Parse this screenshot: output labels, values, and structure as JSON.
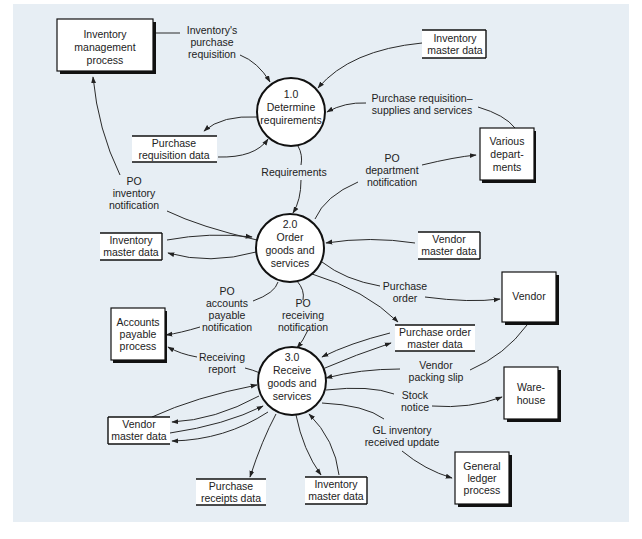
{
  "diagram": {
    "type": "data flow diagram",
    "processes": [
      {
        "id": "p1",
        "number": "1.0",
        "lines": [
          "Determine",
          "requirements"
        ]
      },
      {
        "id": "p2",
        "number": "2.0",
        "lines": [
          "Order",
          "goods and",
          "services"
        ]
      },
      {
        "id": "p3",
        "number": "3.0",
        "lines": [
          "Receive",
          "goods and",
          "services"
        ]
      }
    ],
    "entities": [
      {
        "id": "inv_mgmt",
        "lines": [
          "Inventory",
          "management",
          "process"
        ]
      },
      {
        "id": "various_depts",
        "lines": [
          "Various",
          "depart-",
          "ments"
        ]
      },
      {
        "id": "accounts_payable",
        "lines": [
          "Accounts",
          "payable",
          "process"
        ]
      },
      {
        "id": "vendor",
        "lines": [
          "Vendor"
        ]
      },
      {
        "id": "warehouse",
        "lines": [
          "Ware-",
          "house"
        ]
      },
      {
        "id": "general_ledger",
        "lines": [
          "General",
          "ledger",
          "process"
        ]
      }
    ],
    "data_stores": [
      {
        "id": "inv_master_top",
        "lines": [
          "Inventory",
          "master data"
        ]
      },
      {
        "id": "purchase_req_data",
        "lines": [
          "Purchase",
          "requisition data"
        ]
      },
      {
        "id": "inv_master_mid",
        "lines": [
          "Inventory",
          "master data"
        ]
      },
      {
        "id": "vendor_master_mid",
        "lines": [
          "Vendor",
          "master data"
        ]
      },
      {
        "id": "po_master",
        "lines": [
          "Purchase order",
          "master data"
        ]
      },
      {
        "id": "vendor_master_bottom",
        "lines": [
          "Vendor",
          "master data"
        ]
      },
      {
        "id": "purchase_receipts",
        "lines": [
          "Purchase",
          "receipts data"
        ]
      },
      {
        "id": "inv_master_bottom",
        "lines": [
          "Inventory",
          "master data"
        ]
      }
    ],
    "flow_labels": [
      {
        "id": "inv_purchase_req",
        "lines": [
          "Inventory's",
          "purchase",
          "requisition"
        ]
      },
      {
        "id": "purchase_req_supplies",
        "lines": [
          "Purchase requisition–",
          "supplies and services"
        ]
      },
      {
        "id": "requirements",
        "lines": [
          "Requirements"
        ]
      },
      {
        "id": "po_dept_notification",
        "lines": [
          "PO",
          "department",
          "notification"
        ]
      },
      {
        "id": "po_inventory_notification",
        "lines": [
          "PO",
          "inventory",
          "notification"
        ]
      },
      {
        "id": "purchase_order",
        "lines": [
          "Purchase",
          "order"
        ]
      },
      {
        "id": "po_ap_notification",
        "lines": [
          "PO",
          "accounts",
          "payable",
          "notification"
        ]
      },
      {
        "id": "po_receiving_notification",
        "lines": [
          "PO",
          "receiving",
          "notification"
        ]
      },
      {
        "id": "receiving_report",
        "lines": [
          "Receiving",
          "report"
        ]
      },
      {
        "id": "vendor_packing_slip",
        "lines": [
          "Vendor",
          "packing slip"
        ]
      },
      {
        "id": "stock_notice",
        "lines": [
          "Stock",
          "notice"
        ]
      },
      {
        "id": "gl_inventory_update",
        "lines": [
          "GL inventory",
          "received update"
        ]
      }
    ]
  }
}
